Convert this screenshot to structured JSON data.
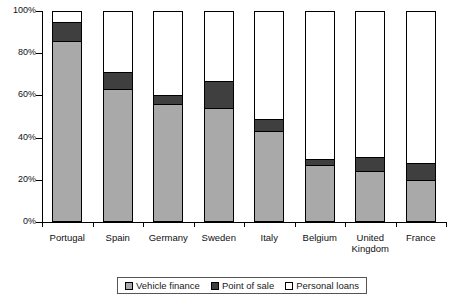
{
  "chart_data": {
    "type": "bar",
    "stacked": true,
    "normalized_percent": true,
    "title": "",
    "subtitle": "",
    "xlabel": "",
    "ylabel": "",
    "ylim": [
      0,
      100
    ],
    "ytick_labels": [
      "0%",
      "20%",
      "40%",
      "60%",
      "80%",
      "100%"
    ],
    "ytick_values": [
      0,
      20,
      40,
      60,
      80,
      100
    ],
    "grid": false,
    "legend_position": "bottom",
    "categories": [
      "Portugal",
      "Spain",
      "Germany",
      "Sweden",
      "Italy",
      "Belgium",
      "United Kingdom",
      "France"
    ],
    "series": [
      {
        "name": "Vehicle finance",
        "color": "#a9a9a9",
        "values": [
          86,
          63,
          56,
          54,
          43,
          27,
          24,
          20
        ]
      },
      {
        "name": "Point of sale",
        "color": "#3f3f3f",
        "values": [
          9,
          8,
          4,
          13,
          6,
          3,
          7,
          8
        ]
      },
      {
        "name": "Personal loans",
        "color": "#ffffff",
        "values": [
          5,
          29,
          40,
          33,
          51,
          70,
          69,
          72
        ]
      }
    ]
  },
  "legend": {
    "items": [
      {
        "label": "Vehicle finance",
        "swatch": "vehicle"
      },
      {
        "label": "Point of sale",
        "swatch": "pos"
      },
      {
        "label": "Personal loans",
        "swatch": "personal"
      }
    ]
  }
}
